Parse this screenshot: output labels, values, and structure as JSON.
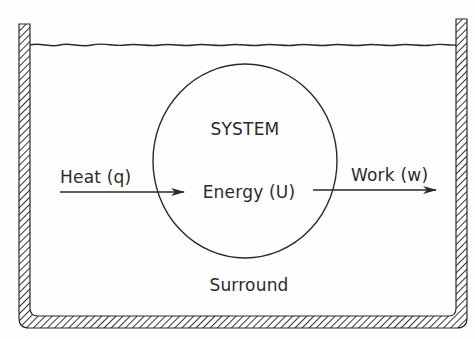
{
  "diagram": {
    "labels": {
      "system": "SYSTEM",
      "energy": "Energy (U)",
      "heat": "Heat (q)",
      "work": "Work (w)",
      "surround": "Surround"
    },
    "nodes": [
      {
        "id": "system",
        "shape": "circle",
        "label": "SYSTEM",
        "content": "Energy (U)"
      },
      {
        "id": "surround",
        "shape": "container",
        "label": "Surround"
      }
    ],
    "edges": [
      {
        "from": "surround",
        "to": "system",
        "label": "Heat (q)",
        "direction": "into system"
      },
      {
        "from": "system",
        "to": "surround",
        "label": "Work (w)",
        "direction": "out of system"
      }
    ],
    "colors": {
      "line": "#2a2a2a",
      "background": "#fefefe"
    }
  }
}
